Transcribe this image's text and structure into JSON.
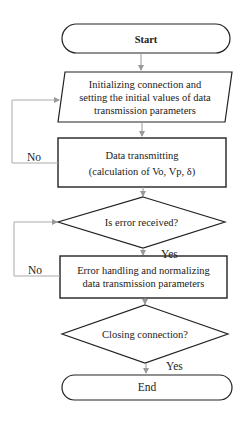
{
  "diagram": {
    "type": "flowchart",
    "nodes": [
      {
        "id": "start",
        "shape": "terminator",
        "label": "Start"
      },
      {
        "id": "init",
        "shape": "parallelogram",
        "label_lines": [
          "Initializing connection and",
          "setting the initial values of data",
          "transmission parameters"
        ]
      },
      {
        "id": "transmit",
        "shape": "rectangle",
        "label_lines": [
          "Data transmitting",
          "(calculation of Vo, Vp, δ)"
        ]
      },
      {
        "id": "error_check",
        "shape": "diamond",
        "label": "Is error received?"
      },
      {
        "id": "error_handling",
        "shape": "rectangle",
        "label_lines": [
          "Error handling and normalizing",
          "data transmission parameters"
        ]
      },
      {
        "id": "closing",
        "shape": "diamond",
        "label": "Closing connection?"
      },
      {
        "id": "end",
        "shape": "terminator",
        "label": "End"
      }
    ],
    "edges": [
      {
        "from": "start",
        "to": "init",
        "label": ""
      },
      {
        "from": "init",
        "to": "transmit",
        "label": ""
      },
      {
        "from": "transmit",
        "to": "init",
        "label": "No"
      },
      {
        "from": "transmit",
        "to": "error_check",
        "label": ""
      },
      {
        "from": "error_check",
        "to": "error_handling",
        "label": "Yes"
      },
      {
        "from": "error_handling",
        "to": "error_check",
        "label": "No"
      },
      {
        "from": "error_handling",
        "to": "closing",
        "label": ""
      },
      {
        "from": "closing",
        "to": "end",
        "label": "Yes"
      }
    ],
    "colors": {
      "stroke": "#222222",
      "arrow": "#999999",
      "loop_line": "#aaaaaa"
    }
  }
}
